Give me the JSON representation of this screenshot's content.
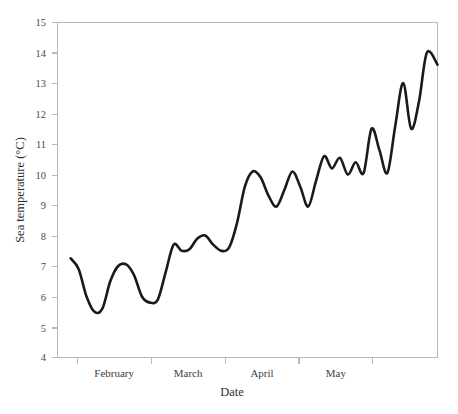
{
  "chart_data": {
    "type": "line",
    "title": "",
    "xlabel": "Date",
    "ylabel": "Sea temperature (°C)",
    "ylim": [
      4,
      15
    ],
    "yticks": [
      4,
      5,
      6,
      7,
      8,
      9,
      10,
      11,
      12,
      13,
      14,
      15
    ],
    "ytick_labels": [
      "4",
      "5",
      "6",
      "7",
      "8",
      "9",
      "10",
      "11",
      "12",
      "13",
      "14",
      "15"
    ],
    "xlim": [
      0,
      144
    ],
    "xtick_positions": [
      7.5,
      35.5,
      63.5,
      91.5,
      119.5
    ],
    "xtick_labels": [
      "",
      "",
      "",
      "",
      ""
    ],
    "x_category_labels": [
      "February",
      "March",
      "April",
      "May"
    ],
    "x_category_centers": [
      21.5,
      49.5,
      77.5,
      105.5
    ],
    "grid": false,
    "legend": null,
    "line_color": "#1a1a1a",
    "line_width": 2.6,
    "axis_color": "#b9b9b9",
    "background": "#ffffff",
    "series": [
      {
        "name": "Sea temperature",
        "x": [
          5,
          8,
          11,
          14,
          17,
          20,
          23,
          26,
          29,
          32,
          35,
          38,
          41,
          44,
          47,
          50,
          53,
          56,
          59,
          62,
          65,
          68,
          71,
          74,
          77,
          80,
          83,
          86,
          89,
          92,
          95,
          98,
          101,
          104,
          107,
          110,
          113,
          116,
          119,
          122,
          125,
          128,
          131,
          134,
          137,
          140
        ],
        "values": [
          7.25,
          6.9,
          6.0,
          5.5,
          5.6,
          6.5,
          7.0,
          7.05,
          6.7,
          6.0,
          5.8,
          5.9,
          6.8,
          7.7,
          7.5,
          7.55,
          7.9,
          8.0,
          7.7,
          7.5,
          7.6,
          8.4,
          9.6,
          10.1,
          9.9,
          9.3,
          8.95,
          9.5,
          10.1,
          9.6,
          8.95,
          9.8,
          10.6,
          10.2,
          10.55,
          10.0,
          10.4,
          10.05,
          11.5,
          10.8,
          10.05,
          11.6,
          13.0,
          11.5,
          12.4,
          14.0
        ],
        "end_x": 144,
        "end_value": 13.6,
        "min_value": 5.5,
        "max_value": 14.0,
        "start_value": 7.25
      }
    ],
    "annotations": []
  },
  "axes": {
    "ylabel": "Sea temperature (°C)",
    "xlabel": "Date"
  },
  "ytick_labels": [
    "15",
    "14",
    "13",
    "12",
    "11",
    "10",
    "9",
    "8",
    "7",
    "6",
    "5",
    "4"
  ],
  "month_labels": [
    "February",
    "March",
    "April",
    "May"
  ]
}
